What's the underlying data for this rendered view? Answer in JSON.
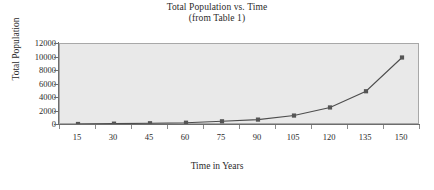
{
  "chart_data": {
    "type": "line",
    "title": "Total Population vs. Time",
    "subtitle": "(from Table 1)",
    "xlabel": "Time in Years",
    "ylabel": "Total Population",
    "categories": [
      15,
      30,
      45,
      60,
      75,
      90,
      105,
      120,
      135,
      150
    ],
    "x_tick_labels": [
      "15",
      "30",
      "45",
      "60",
      "75",
      "90",
      "105",
      "120",
      "135",
      "150"
    ],
    "y_tick_labels": [
      "0",
      "2000",
      "4000",
      "6000",
      "8000",
      "10000",
      "12000"
    ],
    "y_ticks": [
      0,
      2000,
      4000,
      6000,
      8000,
      10000,
      12000
    ],
    "ylim": [
      0,
      12000
    ],
    "grid": false,
    "legend": "none",
    "series": [
      {
        "name": "Total Population",
        "values": [
          150,
          200,
          260,
          340,
          550,
          800,
          1400,
          2600,
          5000,
          10000
        ]
      }
    ],
    "marker": "square",
    "marker_color": "#555555",
    "line_color": "#4d4d4d",
    "plot_background": "#e9e9e9",
    "plot_border_color": "#a8a8a8",
    "axis_color": "#6d6d6d"
  }
}
